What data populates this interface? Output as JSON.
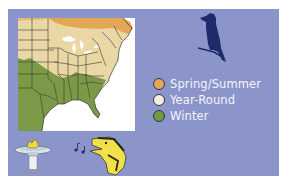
{
  "panel": {
    "background": "#8b95c9"
  },
  "map": {
    "region": "Eastern United States",
    "colors": {
      "spring_summer": "#e2a656",
      "year_round": "#ead7a6",
      "winter": "#7b9a48",
      "outside": "#ffffff",
      "borders": "#3b3a2a"
    }
  },
  "legend": {
    "items": [
      {
        "label": "Spring/Summer",
        "color": "#e2a656"
      },
      {
        "label": "Year-Round",
        "color": "#f3efdc"
      },
      {
        "label": "Winter",
        "color": "#6f9a3e"
      }
    ]
  },
  "icons": {
    "bird_silhouette": "perched-bird-icon",
    "birdbath": "birdbath-icon",
    "singing_bird": "singing-bird-icon",
    "music_notes": "music-notes-icon"
  }
}
